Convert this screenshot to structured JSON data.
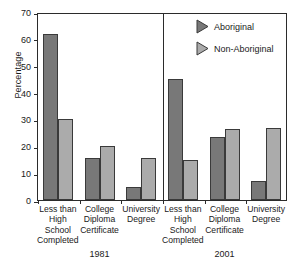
{
  "chart_data": {
    "type": "bar",
    "title": "",
    "subtitle": "",
    "xlabel": "",
    "ylabel": "Percentage",
    "ylim": [
      0,
      70
    ],
    "yticks": [
      0,
      10,
      20,
      30,
      40,
      50,
      60,
      70
    ],
    "grid": false,
    "legend_position": "top-right",
    "panels": [
      {
        "label": "1981",
        "categories": [
          "Less than\nHigh\nSchool\nCompleted",
          "College\nDiploma\nCertificate",
          "University\nDegree"
        ],
        "series": [
          {
            "name": "Aboriginal",
            "values": [
              62,
              15.5,
              5
            ]
          },
          {
            "name": "Non-Aboriginal",
            "values": [
              30,
              20,
              15.5
            ]
          }
        ]
      },
      {
        "label": "2001",
        "categories": [
          "Less than\nHigh\nSchool\nCompleted",
          "College\nDiploma\nCertificate",
          "University\nDegree"
        ],
        "series": [
          {
            "name": "Aboriginal",
            "values": [
              45,
              23.5,
              7
            ]
          },
          {
            "name": "Non-Aboriginal",
            "values": [
              15,
              26.5,
              27
            ]
          }
        ]
      }
    ],
    "legend": [
      {
        "name": "Aboriginal",
        "color": "#787878",
        "marker": "right-triangle"
      },
      {
        "name": "Non-Aboriginal",
        "color": "#ababab",
        "marker": "right-triangle"
      }
    ],
    "colors": {
      "series_a": "#787878",
      "series_b": "#ababab",
      "axis": "#2b2b2b",
      "background": "#ffffff"
    }
  }
}
